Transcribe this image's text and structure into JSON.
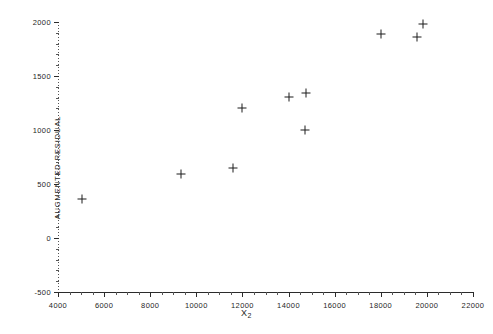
{
  "chart_data": {
    "type": "scatter",
    "title": "",
    "xlabel": "X2",
    "xlabel_base": "X",
    "xlabel_sub": "2",
    "ylabel": "AUGMENTED RESIDUAL",
    "xlim": [
      4000,
      22000
    ],
    "ylim": [
      -500,
      2000
    ],
    "xticks": [
      4000,
      6000,
      8000,
      10000,
      12000,
      14000,
      16000,
      18000,
      20000,
      22000
    ],
    "xtick_labels": [
      "4000",
      "6000",
      "8000",
      "10000",
      "12000",
      "14000",
      "16000",
      "18000",
      "20000",
      "22000"
    ],
    "yticks": [
      -500,
      0,
      500,
      1000,
      1500,
      2000
    ],
    "ytick_labels": [
      "-500",
      "0",
      "500",
      "1000",
      "1500",
      "2000"
    ],
    "x_minor_step": 500,
    "y_minor_step": 100,
    "grid": false,
    "legend": null,
    "marker": "plus",
    "marker_color": "#1d1d1d",
    "series": [
      {
        "name": "augmented residual",
        "points": [
          {
            "x": 5040,
            "y": 360
          },
          {
            "x": 9330,
            "y": 590
          },
          {
            "x": 11590,
            "y": 650
          },
          {
            "x": 11980,
            "y": 1205
          },
          {
            "x": 14000,
            "y": 1305
          },
          {
            "x": 14720,
            "y": 1000
          },
          {
            "x": 14760,
            "y": 1345
          },
          {
            "x": 18000,
            "y": 1890
          },
          {
            "x": 19570,
            "y": 1860
          },
          {
            "x": 19830,
            "y": 1980
          }
        ]
      }
    ]
  }
}
